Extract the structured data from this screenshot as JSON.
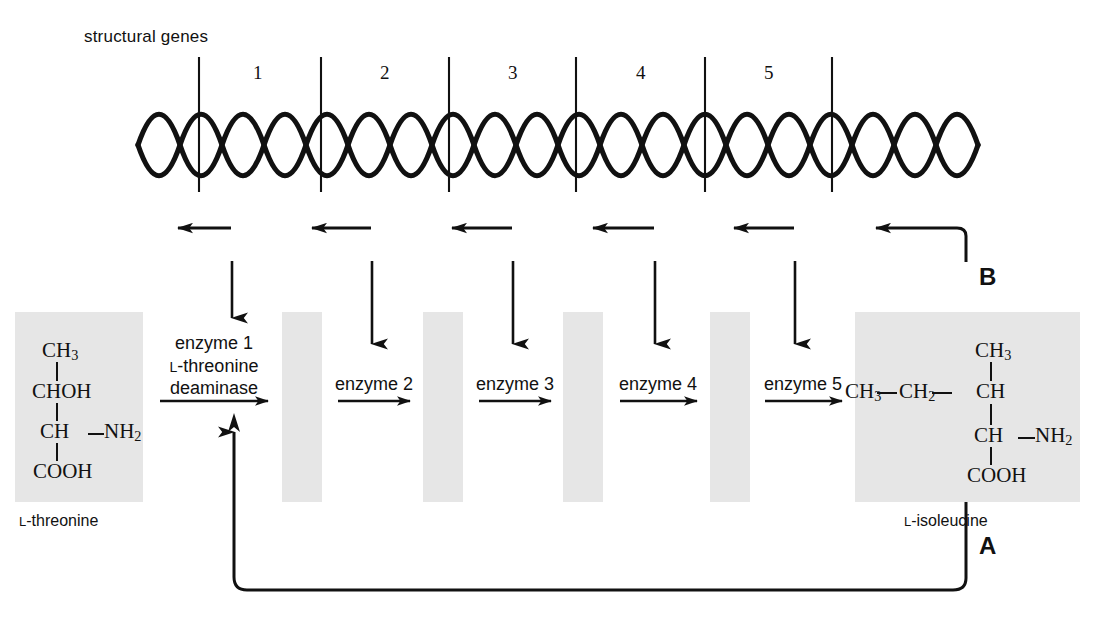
{
  "figure": {
    "type": "diagram"
  },
  "genes": {
    "title": "structural genes",
    "numbers": [
      "1",
      "2",
      "3",
      "4",
      "5"
    ]
  },
  "pathway": {
    "enzymes": [
      {
        "line1": "enzyme 1",
        "line2_prefix": "L",
        "line2_rest": "-threonine",
        "line3": "deaminase"
      },
      {
        "line1": "enzyme 2"
      },
      {
        "line1": "enzyme 3"
      },
      {
        "line1": "enzyme 4"
      },
      {
        "line1": "enzyme 5"
      }
    ]
  },
  "substrate": {
    "caption_prefix": "L",
    "caption_rest": "-threonine",
    "structure": [
      "CH3",
      "CHOH",
      "CH",
      "NH2",
      "COOH"
    ],
    "rows": {
      "r1": "CH3",
      "r2": "CHOH",
      "r3_left": "CH",
      "r3_right": "NH2",
      "r4": "COOH"
    }
  },
  "product": {
    "caption_prefix": "L",
    "caption_rest": "-isoleucine",
    "rows": {
      "top": "CH3",
      "chain_a": "CH3",
      "chain_b": "CH2",
      "chain_c": "CH",
      "r3_left": "CH",
      "r3_right": "NH2",
      "r4": "COOH"
    }
  },
  "loops": {
    "feedback_inhibition": "A",
    "repression": "B"
  },
  "colors": {
    "ink": "#111111",
    "box_fill": "#e6e6e6",
    "background": "#ffffff"
  }
}
